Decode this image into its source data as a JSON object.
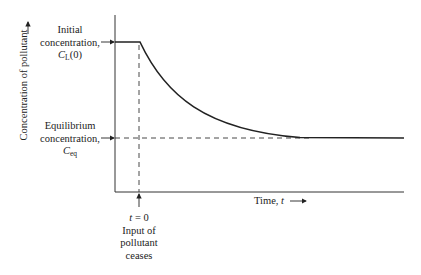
{
  "diagram": {
    "y_axis_label": "Concentration of pollutant",
    "x_axis_label_text": "Time, ",
    "x_axis_label_var": "t",
    "initial": {
      "line1": "Initial",
      "line2": "concentration,",
      "symbol": "C",
      "subscript": "L",
      "suffix": "(0)"
    },
    "equilibrium": {
      "line1": "Equilibrium",
      "line2": "concentration,",
      "symbol": "C",
      "subscript": "eq"
    },
    "event": {
      "t_label_var": "t",
      "t_label_rest": " = 0",
      "line1": "Input of",
      "line2": "pollutant",
      "line3": "ceases"
    },
    "colors": {
      "line": "#222222",
      "background": "#ffffff"
    }
  }
}
